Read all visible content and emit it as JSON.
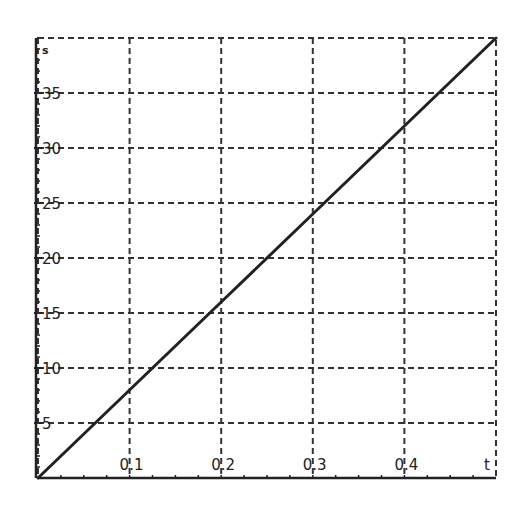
{
  "chart_data": {
    "type": "line",
    "title": "",
    "xlabel": "t",
    "ylabel": "s",
    "xlim": [
      0,
      0.5
    ],
    "ylim": [
      0,
      40
    ],
    "x_ticks": [
      0.1,
      0.2,
      0.3,
      0.4
    ],
    "x_tick_labels": [
      "0.1",
      "0.2",
      "0.3",
      "0.4"
    ],
    "y_ticks": [
      5,
      10,
      15,
      20,
      25,
      30,
      35
    ],
    "y_tick_labels": [
      "5",
      "10",
      "15",
      "20",
      "25",
      "30",
      "35"
    ],
    "x_minor_step": 0.025,
    "y_minor_step": 1,
    "grid": true,
    "grid_style": "dashed",
    "legend": null,
    "series": [
      {
        "name": "s(t)",
        "x": [
          0,
          0.1,
          0.2,
          0.3,
          0.4,
          0.5
        ],
        "y": [
          0,
          8,
          16,
          24,
          32,
          40
        ],
        "color": "#222222"
      }
    ]
  },
  "colors": {
    "grid": "#333333",
    "axis": "#222222",
    "line": "#222222",
    "background": "#ffffff"
  },
  "plot_box": {
    "left": 38,
    "top": 38,
    "right": 496,
    "bottom": 478
  }
}
